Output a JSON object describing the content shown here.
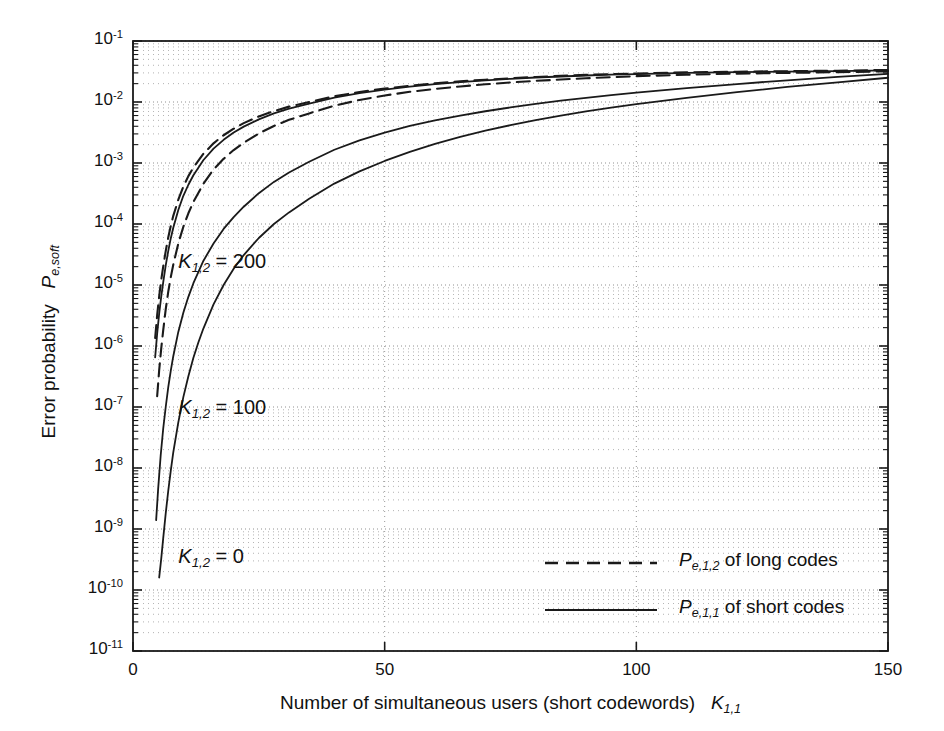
{
  "chart_data": {
    "type": "line",
    "title": "",
    "xlabel": "Number of simultaneous users (short codewords)  K_{1,1}",
    "ylabel": "Error probability  P_{e,soft}",
    "xscale": "linear",
    "yscale": "log",
    "xlim": [
      0,
      150
    ],
    "ylim": [
      1e-11,
      0.1
    ],
    "grid": "both-minor-dotted",
    "xticks": [
      0,
      50,
      100,
      150
    ],
    "xtick_labels": [
      "0",
      "50",
      "100",
      "150"
    ],
    "yticks": [
      1e-11,
      1e-10,
      1e-09,
      1e-08,
      1e-07,
      1e-06,
      1e-05,
      0.0001,
      0.001,
      0.01,
      0.1
    ],
    "ytick_exponents": [
      "-11",
      "-10",
      "-9",
      "-8",
      "-7",
      "-6",
      "-5",
      "-4",
      "-3",
      "-2",
      "-1"
    ],
    "ytick_mantissa": "10",
    "legend_position": "lower-right-inside",
    "legend": [
      {
        "name": "P_{e,1,2} of long codes",
        "style": "dashed",
        "p_main": "P",
        "p_sub": "e,1,2",
        "rest": " of long codes"
      },
      {
        "name": "P_{e,1,1} of short codes",
        "style": "solid",
        "p_main": "P",
        "p_sub": "e,1,1",
        "rest": " of short codes"
      }
    ],
    "annotations": [
      {
        "text": "K_{1,2} = 200",
        "k_main": "K",
        "k_sub": "1,2",
        "rest": " = 200",
        "x_data": 9,
        "y_data": 2.2e-05
      },
      {
        "text": "K_{1,2} = 100",
        "k_main": "K",
        "k_sub": "1,2",
        "rest": " = 100",
        "x_data": 9,
        "y_data": 9e-08
      },
      {
        "text": "K_{1,2} = 0",
        "k_main": "K",
        "k_sub": "1,2",
        "rest": " = 0",
        "x_data": 9,
        "y_data": 3.2e-10
      }
    ],
    "series": [
      {
        "name": "P_e,1,1 of short codes, K_{1,2} = 0",
        "style": "solid",
        "color": "#1a1a1a",
        "x": [
          5.2,
          5.6,
          6,
          6.5,
          7,
          7.5,
          8,
          9,
          10,
          11,
          12,
          13,
          14,
          16,
          18,
          20,
          22,
          25,
          28,
          31,
          35,
          40,
          45,
          50,
          55,
          60,
          65,
          70,
          75,
          80,
          85,
          90,
          95,
          100,
          110,
          120,
          130,
          140,
          150
        ],
        "y": [
          1.6e-10,
          3.2e-10,
          7e-10,
          1.8e-09,
          4.2e-09,
          9e-09,
          1.8e-08,
          5.6e-08,
          1.45e-07,
          3.2e-07,
          6.4e-07,
          1.15e-06,
          1.95e-06,
          4.8e-06,
          1e-05,
          1.85e-05,
          3.1e-05,
          5.9e-05,
          0.0001,
          0.000155,
          0.00026,
          0.00046,
          0.00073,
          0.00108,
          0.00152,
          0.00205,
          0.00267,
          0.00338,
          0.00417,
          0.00505,
          0.006,
          0.007,
          0.0081,
          0.0092,
          0.0117,
          0.0145,
          0.0177,
          0.021,
          0.025
        ]
      },
      {
        "name": "P_e,1,1 of short codes, K_{1,2} = 100",
        "style": "solid",
        "color": "#1a1a1a",
        "x": [
          4.6,
          5,
          5.5,
          6,
          6.5,
          7,
          7.5,
          8,
          9,
          10,
          11,
          12,
          14,
          16,
          18,
          20,
          22,
          25,
          28,
          31,
          35,
          40,
          45,
          50,
          55,
          60,
          65,
          70,
          75,
          80,
          85,
          90,
          95,
          100,
          110,
          120,
          130,
          140,
          150
        ],
        "y": [
          1.4e-09,
          4.6e-09,
          1.6e-08,
          4.4e-08,
          1e-07,
          2.1e-07,
          3.9e-07,
          6.8e-07,
          1.7e-06,
          3.5e-06,
          6.4e-06,
          1.07e-05,
          2.5e-05,
          4.8e-05,
          8.3e-05,
          0.00013,
          0.000192,
          0.00032,
          0.00049,
          0.0007,
          0.00105,
          0.00165,
          0.00235,
          0.00315,
          0.00405,
          0.005,
          0.006,
          0.00705,
          0.00815,
          0.0093,
          0.0105,
          0.0117,
          0.013,
          0.0142,
          0.0169,
          0.0197,
          0.0227,
          0.0258,
          0.029
        ]
      },
      {
        "name": "P_e,1,1 of short codes, K_{1,2} = 200",
        "style": "solid",
        "color": "#1a1a1a",
        "x": [
          4.4,
          4.8,
          5.2,
          5.6,
          6,
          6.5,
          7,
          7.5,
          8,
          9,
          10,
          11,
          12,
          14,
          16,
          18,
          20,
          22,
          25,
          28,
          31,
          35,
          40,
          45,
          50,
          55,
          60,
          65,
          70,
          75,
          80,
          85,
          90,
          95,
          100,
          110,
          120,
          130,
          140,
          150
        ],
        "y": [
          6.5e-07,
          1.6e-06,
          3.4e-06,
          6.4e-06,
          1.1e-05,
          2.1e-05,
          3.6e-05,
          5.8e-05,
          8.7e-05,
          0.00017,
          0.00029,
          0.00044,
          0.00063,
          0.00112,
          0.00172,
          0.0024,
          0.00315,
          0.00395,
          0.0052,
          0.0065,
          0.0078,
          0.0094,
          0.0118,
          0.014,
          0.016,
          0.0179,
          0.0196,
          0.0212,
          0.0226,
          0.024,
          0.0252,
          0.0262,
          0.0272,
          0.028,
          0.0287,
          0.03,
          0.0308,
          0.0314,
          0.032,
          0.033
        ]
      },
      {
        "name": "P_e,1,2 of long codes, K_{1,2} = 200",
        "style": "dashed",
        "color": "#1a1a1a",
        "x": [
          4.4,
          4.8,
          5.2,
          5.6,
          6,
          6.5,
          7,
          7.5,
          8,
          9,
          10,
          11,
          12,
          14,
          16,
          18,
          20,
          22,
          25,
          28,
          31,
          35,
          40,
          45,
          50,
          55,
          60,
          65,
          70,
          75,
          80,
          85,
          90,
          95,
          100,
          110,
          120,
          130,
          140,
          150
        ],
        "y": [
          1.35e-06,
          3.2e-06,
          6.5e-06,
          1.2e-05,
          2e-05,
          3.6e-05,
          6e-05,
          9.3e-05,
          0.000136,
          0.00025,
          0.00041,
          0.00061,
          0.00084,
          0.00142,
          0.0021,
          0.00285,
          0.00365,
          0.0045,
          0.0058,
          0.0071,
          0.0084,
          0.01,
          0.0124,
          0.0146,
          0.0166,
          0.0185,
          0.0202,
          0.0218,
          0.0232,
          0.0245,
          0.0257,
          0.0268,
          0.0278,
          0.0286,
          0.0294,
          0.0306,
          0.0314,
          0.032,
          0.0326,
          0.0335
        ]
      },
      {
        "name": "P_e,1,2 of long codes, K_{1,2} = 100",
        "style": "dashed",
        "color": "#1a1a1a",
        "x": [
          4.8,
          5.2,
          5.6,
          6,
          6.5,
          7,
          7.5,
          8,
          9,
          10,
          11,
          12,
          14,
          16,
          18,
          20,
          22,
          25,
          28,
          31,
          35,
          40,
          45,
          50,
          55,
          60,
          65,
          70,
          75,
          80,
          85,
          90,
          95,
          100,
          110,
          120,
          130,
          140,
          150
        ],
        "y": [
          1.5e-07,
          4e-07,
          9e-07,
          1.8e-06,
          4e-06,
          7.7e-06,
          1.34e-05,
          2.15e-05,
          4.8e-05,
          9e-05,
          0.00015,
          0.00023,
          0.00046,
          0.00078,
          0.00117,
          0.00163,
          0.00215,
          0.00305,
          0.00405,
          0.0051,
          0.0065,
          0.0087,
          0.0108,
          0.0128,
          0.0147,
          0.0164,
          0.018,
          0.0195,
          0.0209,
          0.0222,
          0.0234,
          0.0245,
          0.0255,
          0.0265,
          0.028,
          0.0292,
          0.03,
          0.0308,
          0.0318
        ]
      }
    ]
  },
  "ylabel_parts": {
    "text": "Error probability",
    "p": "P",
    "sub": "e,soft"
  },
  "xlabel_parts": {
    "text": "Number of simultaneous users (short codewords)",
    "k": "K",
    "sub": "1,1"
  }
}
